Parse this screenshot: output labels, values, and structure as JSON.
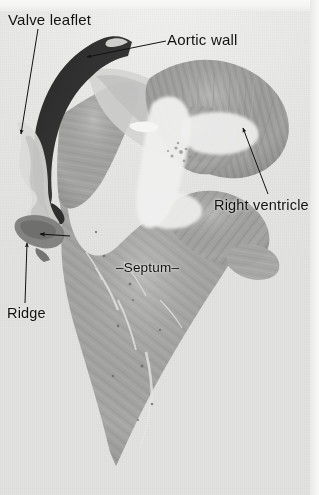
{
  "figure": {
    "kind": "histology-photomicrograph",
    "background_color": "#e9e9e7",
    "annotation_color": "#121212",
    "tissue_color": "#9a9a98",
    "dark_leaflet_color": "#171717"
  },
  "annotations": [
    {
      "id": "valve-leaflet",
      "label": "Valve leaflet",
      "leader": {
        "type": "line-arrow",
        "from": [
          38,
          29
        ],
        "to": [
          21,
          134
        ]
      }
    },
    {
      "id": "aortic-wall",
      "label": "Aortic wall",
      "leader": {
        "type": "line-arrow",
        "from": [
          166,
          41
        ],
        "to": [
          87,
          57
        ]
      }
    },
    {
      "id": "right-ventricle",
      "label": "Right ventricle",
      "leader": {
        "type": "line-arrow",
        "from": [
          268,
          194
        ],
        "to": [
          243,
          128
        ]
      }
    },
    {
      "id": "septum",
      "label": "–Septum–",
      "leader": {
        "type": "none"
      }
    },
    {
      "id": "ridge",
      "label": "Ridge",
      "leader": {
        "type": "line-arrow",
        "from": [
          25,
          303
        ],
        "to": [
          27,
          243
        ]
      }
    },
    {
      "id": "unlabeled-pointer",
      "label": "",
      "leader": {
        "type": "line-arrow",
        "from": [
          70,
          236
        ],
        "to": [
          40,
          234
        ]
      }
    }
  ]
}
